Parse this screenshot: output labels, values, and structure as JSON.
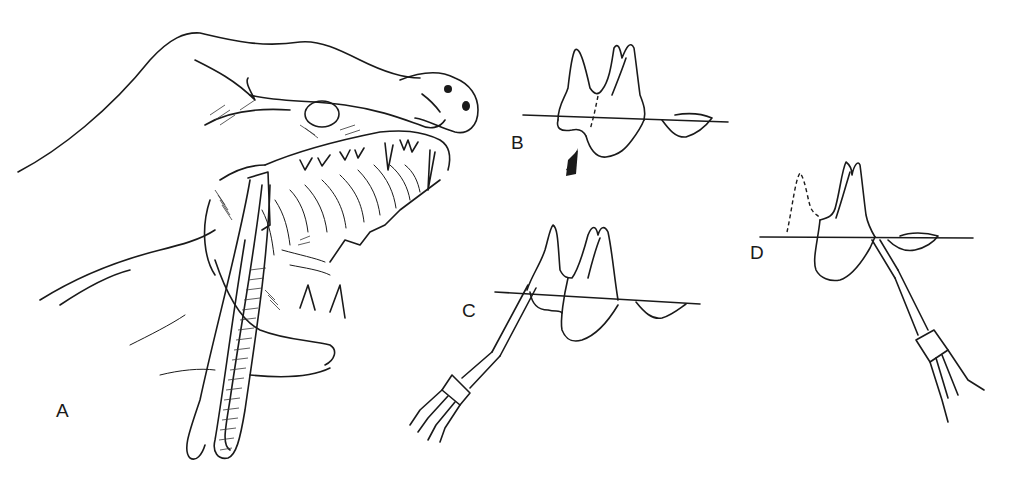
{
  "figure": {
    "panels": [
      {
        "id": "A",
        "label": "A",
        "description": "Hand holding open a dog's mouth while extraction forceps grip a maxillary tooth"
      },
      {
        "id": "B",
        "label": "B",
        "description": "Two-rooted tooth at gingival line with dashed sectioning line; arrow indicating furcation"
      },
      {
        "id": "C",
        "label": "C",
        "description": "Elevator inserted at mesial root to section/loosen tooth"
      },
      {
        "id": "D",
        "label": "D",
        "description": "Mesial segment removed (dashed outline); elevator applied to remaining distal root"
      }
    ]
  }
}
